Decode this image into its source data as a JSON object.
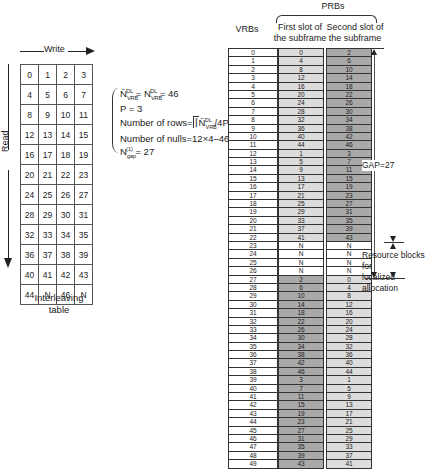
{
  "interleaver": {
    "write_label": "Write",
    "read_label": "Read",
    "caption_line1": "Interleaving",
    "caption_line2": "table",
    "rows": [
      [
        "0",
        "1",
        "2",
        "3"
      ],
      [
        "4",
        "5",
        "6",
        "7"
      ],
      [
        "8",
        "9",
        "10",
        "11"
      ],
      [
        "12",
        "13",
        "14",
        "15"
      ],
      [
        "16",
        "17",
        "18",
        "19"
      ],
      [
        "20",
        "21",
        "22",
        "23"
      ],
      [
        "24",
        "25",
        "26",
        "27"
      ],
      [
        "28",
        "29",
        "30",
        "31"
      ],
      [
        "32",
        "33",
        "34",
        "35"
      ],
      [
        "36",
        "37",
        "38",
        "39"
      ],
      [
        "40",
        "41",
        "42",
        "43"
      ],
      [
        "44",
        "N",
        "46",
        "N"
      ]
    ]
  },
  "equations": {
    "eq1": "Ñ_VRB^DL = N_VRB^DL = 46",
    "eq1_a": "Ñ",
    "eq1_a_sub": "VRB",
    "eq1_a_sup": "DL",
    "eq1_b": " = N",
    "eq1_b_sub": "VRB",
    "eq1_b_sup": "DL",
    "eq1_c": " = 46",
    "eq2": "P = 3",
    "eq3_prefix": "Number of rows=",
    "eq3_mid": "Ñ",
    "eq3_sub": "VRB",
    "eq3_sup": "DL",
    "eq3_suffix": " /4P",
    "eq3_tail": "P = 12",
    "eq4": "Number of nulls=12×4–46",
    "eq5_a": "N",
    "eq5_sub": "gap",
    "eq5_sup": "(1)",
    "eq5_c": " = 27"
  },
  "headers": {
    "prbs": "PRBs",
    "vrbs": "VRBs",
    "first_slot_line1": "First slot of",
    "first_slot_line2": "the subframe",
    "second_slot_line1": "Second slot of",
    "second_slot_line2": "the subframe"
  },
  "annotations": {
    "gap": "GAP=27",
    "localized_line1": "Resource blocks for",
    "localized_line2": "localized allocation"
  },
  "colors": {
    "light_cell": "#dcdcdc",
    "dark_cell": "#a9a9a9",
    "null_cell": "#ffffff"
  },
  "vrbs": [
    "0",
    "1",
    "2",
    "3",
    "4",
    "5",
    "6",
    "7",
    "8",
    "9",
    "10",
    "11",
    "12",
    "13",
    "14",
    "15",
    "16",
    "17",
    "18",
    "19",
    "20",
    "21",
    "22",
    "23",
    "24",
    "25",
    "26",
    "27",
    "28",
    "29",
    "30",
    "31",
    "32",
    "33",
    "34",
    "35",
    "36",
    "37",
    "38",
    "39",
    "40",
    "41",
    "42",
    "43",
    "44",
    "45",
    "46",
    "47",
    "48",
    "49"
  ],
  "first_slot": [
    "0",
    "4",
    "8",
    "12",
    "16",
    "20",
    "24",
    "28",
    "32",
    "36",
    "40",
    "44",
    "1",
    "5",
    "9",
    "13",
    "17",
    "21",
    "25",
    "29",
    "33",
    "37",
    "41",
    "N",
    "N",
    "N",
    "N",
    "2",
    "6",
    "10",
    "14",
    "18",
    "22",
    "26",
    "30",
    "34",
    "38",
    "42",
    "46",
    "3",
    "7",
    "11",
    "15",
    "19",
    "23",
    "27",
    "31",
    "35",
    "39",
    "43"
  ],
  "second_slot": [
    "2",
    "6",
    "10",
    "14",
    "18",
    "22",
    "26",
    "30",
    "34",
    "38",
    "42",
    "46",
    "3",
    "7",
    "11",
    "15",
    "19",
    "23",
    "27",
    "31",
    "35",
    "39",
    "43",
    "N",
    "N",
    "N",
    "N",
    "0",
    "4",
    "8",
    "12",
    "16",
    "20",
    "24",
    "28",
    "32",
    "36",
    "40",
    "44",
    "1",
    "5",
    "9",
    "13",
    "17",
    "21",
    "25",
    "29",
    "33",
    "37",
    "41"
  ]
}
